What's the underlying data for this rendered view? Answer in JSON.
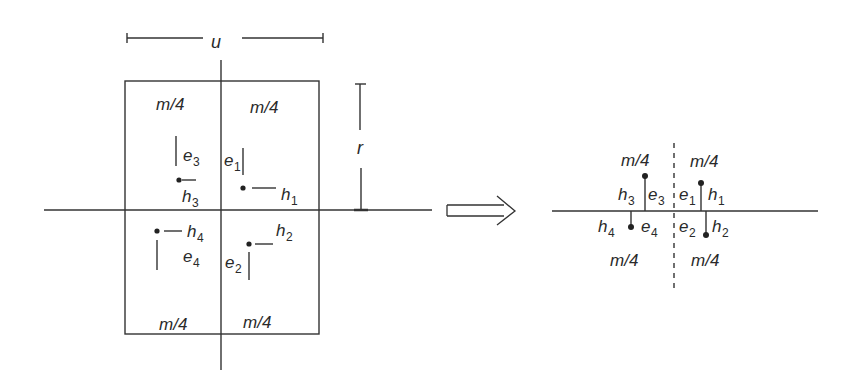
{
  "diagram": {
    "left": {
      "width_label": "u",
      "height_label": "r",
      "quadrant_labels": [
        "m/4",
        "m/4",
        "m/4",
        "m/4"
      ],
      "points": [
        {
          "e": "e",
          "e_sub": "1",
          "h": "h",
          "h_sub": "1"
        },
        {
          "e": "e",
          "e_sub": "2",
          "h": "h",
          "h_sub": "2"
        },
        {
          "e": "e",
          "e_sub": "3",
          "h": "h",
          "h_sub": "3"
        },
        {
          "e": "e",
          "e_sub": "4",
          "h": "h",
          "h_sub": "4"
        }
      ]
    },
    "arrow": "implies-arrow",
    "right": {
      "quadrant_labels": [
        "m/4",
        "m/4",
        "m/4",
        "m/4"
      ],
      "points": [
        {
          "e": "e",
          "e_sub": "1",
          "h": "h",
          "h_sub": "1"
        },
        {
          "e": "e",
          "e_sub": "2",
          "h": "h",
          "h_sub": "2"
        },
        {
          "e": "e",
          "e_sub": "3",
          "h": "h",
          "h_sub": "3"
        },
        {
          "e": "e",
          "e_sub": "4",
          "h": "h",
          "h_sub": "4"
        }
      ]
    },
    "colors": {
      "stroke": "#333333",
      "text": "#2a2a2a"
    }
  }
}
